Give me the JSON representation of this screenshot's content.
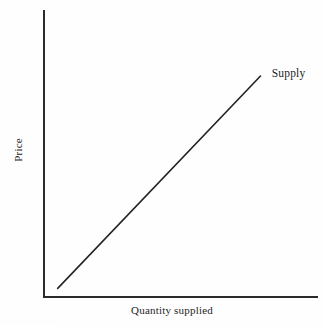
{
  "figure": {
    "background_color": "#fefefe",
    "ink_color": "#232323",
    "width": 324,
    "height": 326
  },
  "chart_data": {
    "type": "line",
    "title": "",
    "subtitle": "",
    "xlabel": "Quantity supplied",
    "ylabel": "Price",
    "grid": false,
    "legend_position": "inline-right-of-curve",
    "xlim": [
      0,
      1
    ],
    "ylim": [
      0,
      1
    ],
    "xticks": [],
    "yticks": [],
    "xticklabels": [],
    "yticklabels": [],
    "axis_arrows": false,
    "annotations": [
      {
        "text": "Supply",
        "x": 0.82,
        "y": 0.76,
        "anchor": "left"
      }
    ],
    "series": [
      {
        "name": "Supply",
        "label": "Supply",
        "color": "#232323",
        "linewidth": 1.6,
        "x": [
          0.05,
          0.79
        ],
        "y": [
          0.03,
          0.77
        ],
        "description": "Upward-sloping straight supply curve"
      }
    ]
  },
  "labels": {
    "series_supply": "Supply",
    "x_axis": "Quantity supplied",
    "y_axis": "Price"
  },
  "artifacts": {
    "scan_bleed_text": "· · ·  · ·   ·· ·  ·  ·· ·"
  }
}
